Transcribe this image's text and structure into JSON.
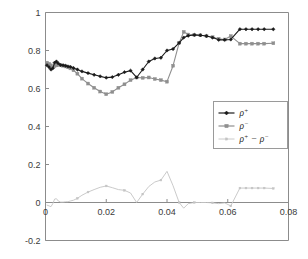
{
  "chart_data": {
    "type": "line",
    "title": "",
    "xlabel": "",
    "ylabel": "",
    "xlim": [
      0,
      0.08
    ],
    "ylim": [
      -0.2,
      1.0
    ],
    "xticks": [
      0,
      0.02,
      0.04,
      0.06,
      0.08
    ],
    "xtick_labels": [
      "0",
      "0.02",
      "0.04",
      "0.06",
      "0.08"
    ],
    "yticks": [
      -0.2,
      0,
      0.2,
      0.4,
      0.6,
      0.8,
      1.0
    ],
    "ytick_labels": [
      "-0.2",
      "0",
      "0.2",
      "0.4",
      "0.6",
      "0.8",
      "1"
    ],
    "grid": false,
    "legend_position": "center-right",
    "series": [
      {
        "name": "rho_plus",
        "label": "ρ+",
        "label_base": "ρ",
        "label_sup": "+",
        "color": "#1a1a1a",
        "marker": "diamond",
        "x": [
          0.0005,
          0.0012,
          0.0018,
          0.0024,
          0.003,
          0.0036,
          0.0042,
          0.005,
          0.0058,
          0.0066,
          0.0074,
          0.0082,
          0.0092,
          0.0105,
          0.012,
          0.014,
          0.016,
          0.018,
          0.02,
          0.022,
          0.024,
          0.026,
          0.028,
          0.03,
          0.032,
          0.034,
          0.036,
          0.038,
          0.04,
          0.042,
          0.044,
          0.0455,
          0.047,
          0.049,
          0.051,
          0.053,
          0.055,
          0.057,
          0.059,
          0.061,
          0.064,
          0.066,
          0.068,
          0.07,
          0.072,
          0.075
        ],
        "y": [
          0.722,
          0.712,
          0.7,
          0.706,
          0.736,
          0.742,
          0.732,
          0.724,
          0.722,
          0.72,
          0.716,
          0.714,
          0.708,
          0.7,
          0.69,
          0.681,
          0.672,
          0.664,
          0.657,
          0.66,
          0.672,
          0.686,
          0.694,
          0.658,
          0.7,
          0.742,
          0.758,
          0.762,
          0.8,
          0.808,
          0.84,
          0.868,
          0.878,
          0.882,
          0.88,
          0.876,
          0.868,
          0.856,
          0.856,
          0.858,
          0.912,
          0.912,
          0.912,
          0.912,
          0.912,
          0.912
        ]
      },
      {
        "name": "rho_minus",
        "label": "ρ-",
        "label_base": "ρ",
        "label_sup": "−",
        "color": "#8f8f8f",
        "marker": "square",
        "x": [
          0.0005,
          0.0012,
          0.0018,
          0.0024,
          0.003,
          0.0036,
          0.0042,
          0.005,
          0.0058,
          0.0066,
          0.0074,
          0.0082,
          0.0092,
          0.0105,
          0.012,
          0.014,
          0.016,
          0.018,
          0.02,
          0.022,
          0.024,
          0.026,
          0.028,
          0.03,
          0.032,
          0.034,
          0.036,
          0.038,
          0.04,
          0.042,
          0.044,
          0.0455,
          0.047,
          0.049,
          0.051,
          0.053,
          0.055,
          0.057,
          0.059,
          0.061,
          0.064,
          0.066,
          0.068,
          0.07,
          0.072,
          0.075
        ],
        "y": [
          0.736,
          0.73,
          0.722,
          0.712,
          0.718,
          0.722,
          0.724,
          0.722,
          0.72,
          0.716,
          0.712,
          0.706,
          0.696,
          0.678,
          0.652,
          0.626,
          0.604,
          0.584,
          0.57,
          0.582,
          0.604,
          0.622,
          0.644,
          0.658,
          0.656,
          0.658,
          0.65,
          0.644,
          0.636,
          0.72,
          0.84,
          0.898,
          0.884,
          0.882,
          0.88,
          0.876,
          0.87,
          0.862,
          0.858,
          0.876,
          0.836,
          0.836,
          0.836,
          0.836,
          0.836,
          0.838
        ]
      },
      {
        "name": "rho_difference",
        "label": "ρ+ − ρ-",
        "color": "#c4c4c4",
        "marker": "square",
        "x": [
          0.0005,
          0.0012,
          0.0018,
          0.0024,
          0.003,
          0.0036,
          0.0042,
          0.005,
          0.0058,
          0.0066,
          0.0074,
          0.0082,
          0.0092,
          0.0105,
          0.012,
          0.014,
          0.016,
          0.018,
          0.02,
          0.022,
          0.024,
          0.026,
          0.028,
          0.03,
          0.032,
          0.034,
          0.036,
          0.038,
          0.04,
          0.042,
          0.044,
          0.0455,
          0.047,
          0.049,
          0.051,
          0.053,
          0.055,
          0.057,
          0.059,
          0.061,
          0.064,
          0.066,
          0.068,
          0.07,
          0.072,
          0.075
        ],
        "y": [
          -0.014,
          -0.018,
          -0.022,
          -0.006,
          0.018,
          0.02,
          0.008,
          0.002,
          0.002,
          0.004,
          0.004,
          0.008,
          0.012,
          0.022,
          0.038,
          0.055,
          0.068,
          0.08,
          0.087,
          0.078,
          0.068,
          0.064,
          0.05,
          0.0,
          0.044,
          0.084,
          0.108,
          0.118,
          0.164,
          0.088,
          0.0,
          -0.03,
          -0.006,
          0.0,
          0.0,
          0.0,
          -0.002,
          -0.006,
          -0.002,
          -0.018,
          0.076,
          0.076,
          0.076,
          0.076,
          0.076,
          0.074
        ]
      }
    ]
  },
  "legend": {
    "items": [
      {
        "name": "legend-rho-plus",
        "base": "ρ",
        "sup": "+",
        "color": "#1a1a1a",
        "marker": "diamond"
      },
      {
        "name": "legend-rho-minus",
        "base": "ρ",
        "sup": "−",
        "color": "#8f8f8f",
        "marker": "square"
      },
      {
        "name": "legend-rho-diff",
        "base": "ρ",
        "sup": "+",
        "base2": "ρ",
        "sup2": "−",
        "op": "−",
        "color": "#c4c4c4",
        "marker": "square"
      }
    ]
  }
}
